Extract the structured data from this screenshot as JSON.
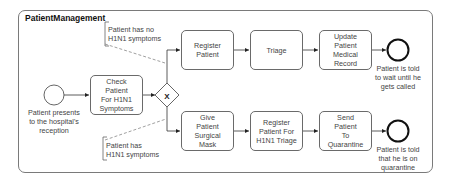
{
  "pool": {
    "title": "PatientManagement"
  },
  "start_event": {
    "label": "Patient presents\nto the hospital's\nreception"
  },
  "tasks": {
    "check": {
      "label": "Check\nPatient\nFor H1N1\nSymptoms"
    },
    "register_patient": {
      "label": "Register\nPatient"
    },
    "triage": {
      "label": "Triage"
    },
    "update_record": {
      "label": "Update\nPatient\nMedical\nRecord"
    },
    "give_mask": {
      "label": "Give\nPatient\nSurgical\nMask"
    },
    "register_h1n1": {
      "label": "Register\nPatient For\nH1N1 Triage"
    },
    "send_quarantine": {
      "label": "Send\nPatient\nTo\nQuarantine"
    }
  },
  "gateway": {
    "type": "exclusive",
    "marker": "X"
  },
  "end_events": {
    "wait": {
      "label": "Patient is told\nto wait until he\ngets called"
    },
    "quarantine": {
      "label": "Patient is told\nthat he is on\nquarantine"
    }
  },
  "annotations": {
    "no_symptoms": {
      "text": "Patient has no\nH1N1 symptoms"
    },
    "has_symptoms": {
      "text": "Patient has\nH1N1 symptoms"
    }
  },
  "colors": {
    "stroke": "#555555",
    "text": "#444444",
    "background": "#ffffff"
  }
}
